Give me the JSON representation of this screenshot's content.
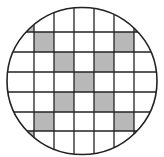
{
  "diagram": {
    "type": "circle-grid",
    "cropped_top_text": "",
    "circle": {
      "cx": 82,
      "cy": 81,
      "rx": 75,
      "ry": 73.5
    },
    "grid": {
      "columns": 7,
      "rows": 7,
      "x0": 14,
      "y0": 12,
      "cell": 20,
      "vertical_lines_x": [
        34,
        54,
        74,
        94,
        114,
        134
      ],
      "horizontal_lines_y": [
        32,
        52,
        72,
        92,
        112,
        131
      ]
    },
    "shaded_cells": [
      [
        0,
        0
      ],
      [
        1,
        1
      ],
      [
        2,
        2
      ],
      [
        3,
        3
      ],
      [
        4,
        4
      ],
      [
        5,
        5
      ],
      [
        6,
        6
      ],
      [
        6,
        0
      ],
      [
        5,
        1
      ],
      [
        4,
        2
      ],
      [
        2,
        4
      ],
      [
        1,
        5
      ],
      [
        0,
        6
      ]
    ],
    "colors": {
      "shade": "#b8b8b8",
      "line": "#222222",
      "background": "#ffffff"
    }
  }
}
